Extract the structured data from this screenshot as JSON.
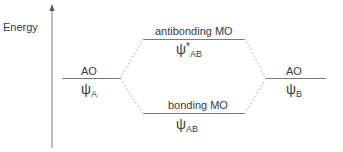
{
  "axis": {
    "label": "Energy"
  },
  "left_ao": {
    "label": "AO",
    "psi": "ψ",
    "subscript": "A"
  },
  "right_ao": {
    "label": "AO",
    "psi": "ψ",
    "subscript": "B"
  },
  "antibonding": {
    "label": "antibonding MO",
    "psi": "ψ",
    "superscript": "*",
    "subscript": "AB"
  },
  "bonding": {
    "label": "bonding MO",
    "psi": "ψ",
    "subscript": "AB"
  },
  "colors": {
    "line": "#7a7a7a",
    "dashed": "#b0b0b0",
    "text": "#3a3a3a"
  }
}
